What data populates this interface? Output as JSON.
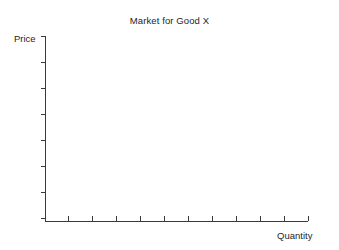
{
  "figure": {
    "title": "Market for Good X",
    "y_axis_label": "Price",
    "x_axis_label": "Quantity",
    "background_color": "#ffffff",
    "axis_color": "#3a3a3a",
    "text_color": "#1e1e1e"
  },
  "chart_data": {
    "type": "line",
    "title": "Market for Good X",
    "subtitle": "",
    "xlabel": "Quantity",
    "ylabel": "Price",
    "series": [],
    "x": [],
    "values": [],
    "annotations": [],
    "legend": {
      "entries": [],
      "position": "none",
      "visible": false
    },
    "grid": false,
    "xlim": [
      0,
      10
    ],
    "ylim": [
      0,
      8
    ],
    "x_tick_labels": [],
    "y_tick_labels": [],
    "x_tick_count": 11,
    "y_tick_count": 8,
    "x_tick_direction": "inward",
    "y_tick_direction": "outward",
    "note": "Empty labeled axes; no data series plotted"
  },
  "geometry": {
    "origin_x": 45,
    "origin_y": 221,
    "axis_top_y": 36,
    "axis_right_x": 308,
    "x_tick_positions": [
      68,
      92,
      116,
      140,
      164,
      188,
      212,
      236,
      260,
      284,
      308
    ],
    "y_tick_positions": [
      36,
      62,
      88,
      114,
      140,
      166,
      192,
      218
    ]
  }
}
